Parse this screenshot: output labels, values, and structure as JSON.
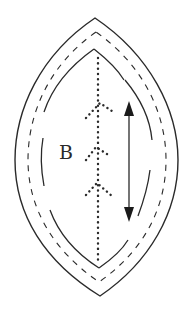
{
  "diagram": {
    "label": "B",
    "colors": {
      "stroke": "#2a2a2a",
      "background": "#ffffff"
    },
    "outlines": [
      {
        "name": "outer-cut-line",
        "style": "solid"
      },
      {
        "name": "seam-line",
        "style": "dashed"
      },
      {
        "name": "inner-line",
        "style": "solid-broken"
      }
    ],
    "center_line": {
      "style": "dotted",
      "chevron_count": 3
    },
    "arrow": {
      "type": "double-headed",
      "orientation": "vertical",
      "meaning": "grainline"
    }
  }
}
